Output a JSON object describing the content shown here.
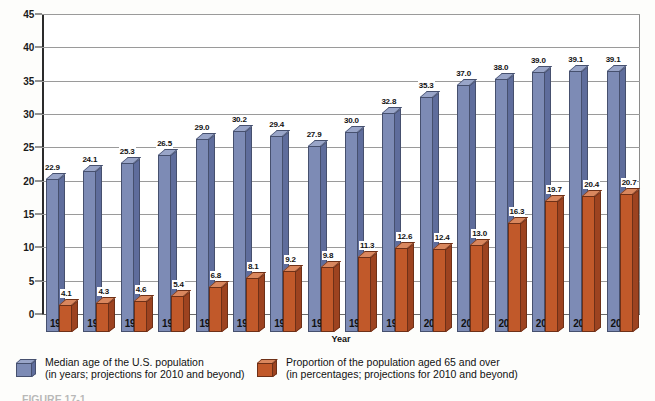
{
  "chart_data": {
    "type": "bar",
    "title": "",
    "xlabel": "Year",
    "ylabel": "",
    "ylim": [
      0,
      45
    ],
    "ytick_step": 5,
    "yticks": [
      0,
      5,
      10,
      15,
      20,
      25,
      30,
      35,
      40,
      45
    ],
    "grid": true,
    "legend_position": "bottom",
    "categories": [
      "1900",
      "1910",
      "1920",
      "1930",
      "1940",
      "1950",
      "1960",
      "1970",
      "1980",
      "1990",
      "2000",
      "2010",
      "2020",
      "2030",
      "2040",
      "2050"
    ],
    "series": [
      {
        "name": "Median age of the U.S. population",
        "color": "#7d8bb5",
        "values": [
          22.9,
          24.1,
          25.3,
          26.5,
          29.0,
          30.2,
          29.4,
          27.9,
          30.0,
          32.8,
          35.3,
          37.0,
          38.0,
          39.0,
          39.1,
          39.1
        ],
        "labels": [
          "22.9",
          "24.1",
          "25.3",
          "26.5",
          "29.0",
          "30.2",
          "29.4",
          "27.9",
          "30.0",
          "32.8",
          "35.3",
          "37.0",
          "38.0",
          "39.0",
          "39.1",
          "39.1"
        ]
      },
      {
        "name": "Proportion of the population aged 65 and over",
        "color": "#c1592a",
        "values": [
          4.1,
          4.3,
          4.6,
          5.4,
          6.8,
          8.1,
          9.2,
          9.8,
          11.3,
          12.6,
          12.4,
          13.0,
          16.3,
          19.7,
          20.4,
          20.7
        ],
        "labels": [
          "4.1",
          "4.3",
          "4.6",
          "5.4",
          "6.8",
          "8.1",
          "9.2",
          "9.8",
          "11.3",
          "12.6",
          "12.4",
          "13.0",
          "16.3",
          "19.7",
          "20.4",
          "20.7"
        ]
      }
    ]
  },
  "axis": {
    "x_title": "Year"
  },
  "legend": {
    "entries": [
      {
        "swatch": "blue-cube-icon",
        "line1": "Median age of the U.S. population",
        "line2": "(in years; projections for 2010 and beyond)"
      },
      {
        "swatch": "orange-cube-icon",
        "line1": "Proportion of the population aged 65 and over",
        "line2": "(in percentages; projections for 2010 and beyond)"
      }
    ]
  },
  "caption": {
    "text": "FIGURE 17-1"
  }
}
